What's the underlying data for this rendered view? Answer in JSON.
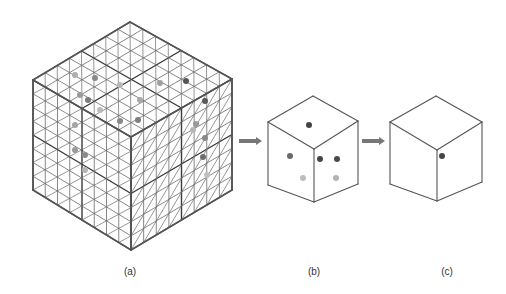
{
  "figure": {
    "panels": [
      {
        "id": "a",
        "label": "(a)",
        "description": "Large isometric cube subdivided into an 8x8x8 grid with triangular diagonals, containing scattered gray points",
        "label_pos": [
          130,
          272
        ],
        "cube": {
          "top": [
            130,
            22
          ],
          "lt": [
            33,
            80
          ],
          "rt": [
            232,
            79
          ],
          "center": [
            131,
            137
          ],
          "lb": [
            33,
            190
          ],
          "rb": [
            232,
            190
          ],
          "bottom": [
            131,
            250
          ]
        },
        "grid_divisions": 8,
        "major_every": 4,
        "points": [
          {
            "x": 75,
            "y": 75,
            "shade": "#b0b0b0"
          },
          {
            "x": 95,
            "y": 78,
            "shade": "#8a8a8a"
          },
          {
            "x": 80,
            "y": 95,
            "shade": "#9a9a9a"
          },
          {
            "x": 88,
            "y": 100,
            "shade": "#7a7a7a"
          },
          {
            "x": 120,
            "y": 85,
            "shade": "#b8b8b8"
          },
          {
            "x": 140,
            "y": 100,
            "shade": "#a8a8a8"
          },
          {
            "x": 160,
            "y": 83,
            "shade": "#a0a0a0"
          },
          {
            "x": 186,
            "y": 81,
            "shade": "#555555"
          },
          {
            "x": 205,
            "y": 101,
            "shade": "#5a5a5a"
          },
          {
            "x": 120,
            "y": 121,
            "shade": "#8a8a8a"
          },
          {
            "x": 138,
            "y": 120,
            "shade": "#7f7f7f"
          },
          {
            "x": 100,
            "y": 110,
            "shade": "#bbbbbb"
          },
          {
            "x": 75,
            "y": 150,
            "shade": "#9a9a9a"
          },
          {
            "x": 85,
            "y": 155,
            "shade": "#8c8c8c"
          },
          {
            "x": 85,
            "y": 170,
            "shade": "#b5b5b5"
          },
          {
            "x": 75,
            "y": 125,
            "shade": "#a5a5a5"
          },
          {
            "x": 196,
            "y": 124,
            "shade": "#9a9a9a"
          },
          {
            "x": 205,
            "y": 138,
            "shade": "#8a8a8a"
          },
          {
            "x": 203,
            "y": 157,
            "shade": "#6d6d6d"
          },
          {
            "x": 207,
            "y": 175,
            "shade": "#c0c0c0"
          },
          {
            "x": 193,
            "y": 130,
            "shade": "#b5b5b5"
          }
        ]
      },
      {
        "id": "b",
        "label": "(b)",
        "description": "Single cube cell with six points",
        "label_pos": [
          314,
          272
        ],
        "cube": {
          "top": [
            313,
            96
          ],
          "lt": [
            268,
            122
          ],
          "rt": [
            358,
            121
          ],
          "center": [
            314,
            149
          ],
          "lb": [
            268,
            185
          ],
          "rb": [
            358,
            184
          ],
          "bottom": [
            314,
            202
          ]
        },
        "points": [
          {
            "x": 309,
            "y": 125,
            "shade": "#444444"
          },
          {
            "x": 290,
            "y": 156,
            "shade": "#6a6a6a"
          },
          {
            "x": 320,
            "y": 159,
            "shade": "#444444"
          },
          {
            "x": 337,
            "y": 159,
            "shade": "#4a4a4a"
          },
          {
            "x": 303,
            "y": 178,
            "shade": "#bdbdbd"
          },
          {
            "x": 336,
            "y": 178,
            "shade": "#b3b3b3"
          }
        ]
      },
      {
        "id": "c",
        "label": "(c)",
        "description": "Single cube cell with one representative point",
        "label_pos": [
          447,
          272
        ],
        "cube": {
          "top": [
            436,
            96
          ],
          "lt": [
            390,
            122
          ],
          "rt": [
            482,
            122
          ],
          "center": [
            437,
            150
          ],
          "lb": [
            390,
            184
          ],
          "rb": [
            482,
            182
          ],
          "bottom": [
            437,
            201
          ]
        },
        "points": [
          {
            "x": 442,
            "y": 156,
            "shade": "#444444"
          }
        ]
      }
    ],
    "arrows": [
      {
        "from": [
          239,
          141
        ],
        "to": [
          262,
          141
        ],
        "color": "#777777"
      },
      {
        "from": [
          362,
          141
        ],
        "to": [
          385,
          141
        ],
        "color": "#777777"
      }
    ],
    "colors": {
      "line": "#555555",
      "grid_minor": "#6a6a6a",
      "grid_major": "#3a3a3a",
      "background": "#ffffff"
    }
  }
}
